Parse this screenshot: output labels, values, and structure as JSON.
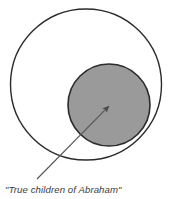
{
  "diagram": {
    "background_color": "#ffffff",
    "outer_circle": {
      "name": "outer-circle",
      "fill_color": "#ffffff",
      "stroke_color": "#2b2b2b",
      "stroke_width": 1.4,
      "cx": 86,
      "cy": 84.5,
      "r": 75.5,
      "label": ""
    },
    "inner_circle": {
      "name": "inner-circle",
      "fill_color": "#9a9a9a",
      "stroke_color": "#2b2b2b",
      "stroke_width": 1.6,
      "cx": 109,
      "cy": 105,
      "r": 41,
      "label": ""
    },
    "annotation": {
      "text": "\"True children of Abraham\"",
      "text_x": 5,
      "text_y": 193,
      "color": "#3b3b3b",
      "font_style": "italic",
      "font_size": 9.6
    },
    "arrow": {
      "name": "annotation-arrow",
      "color": "#555555",
      "stroke_width": 1.1,
      "tail_x": 37,
      "tail_y": 179,
      "tip_x": 110,
      "tip_y": 105,
      "head_length": 11,
      "head_width": 7
    }
  }
}
